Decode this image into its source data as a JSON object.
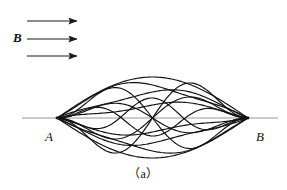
{
  "figure": {
    "caption": "（a）",
    "field_label": "B",
    "point_a_label": "A",
    "point_b_label": "B",
    "colors": {
      "trajectory": "#111111",
      "axis": "#8c8c8c",
      "arrow": "#1a1a1a",
      "background": "#ffffff",
      "text": "#111111"
    },
    "axis": {
      "x_start": 22,
      "x_end": 278,
      "y": 118
    },
    "focus_points": {
      "a": {
        "x": 57,
        "y": 118
      },
      "b": {
        "x": 248,
        "y": 118
      }
    },
    "field_arrows": [
      {
        "x1": 27,
        "y": 21,
        "x2": 77
      },
      {
        "x1": 27,
        "y": 39,
        "x2": 77
      },
      {
        "x1": 27,
        "y": 56,
        "x2": 77
      }
    ]
  },
  "chart_data": {
    "type": "line",
    "title": "",
    "xlabel": "",
    "ylabel": "",
    "xlim": [
      57,
      248
    ],
    "ylim": [
      158,
      77
    ],
    "grid": false,
    "legend": null,
    "series": [
      {
        "name": "trajectory-1",
        "amplitude": -41,
        "lobes": 1.0,
        "phase": 0.0,
        "skew": 0.0
      },
      {
        "name": "trajectory-2",
        "amplitude": -33,
        "lobes": 1.0,
        "phase": 0.0,
        "skew": 0.22
      },
      {
        "name": "trajectory-3",
        "amplitude": -26,
        "lobes": 1.0,
        "phase": 0.0,
        "skew": -0.24
      },
      {
        "name": "trajectory-4",
        "amplitude": -36,
        "lobes": 2.0,
        "phase": 0.0,
        "skew": 0.1
      },
      {
        "name": "trajectory-5",
        "amplitude": 31,
        "lobes": 2.0,
        "phase": 0.0,
        "skew": -0.12
      },
      {
        "name": "trajectory-6",
        "amplitude": 40,
        "lobes": 1.0,
        "phase": 0.0,
        "skew": 0.0
      },
      {
        "name": "trajectory-7",
        "amplitude": 33,
        "lobes": 1.0,
        "phase": 0.0,
        "skew": -0.2
      },
      {
        "name": "trajectory-8",
        "amplitude": 25,
        "lobes": 1.0,
        "phase": 0.0,
        "skew": 0.26
      },
      {
        "name": "trajectory-9",
        "amplitude": 34,
        "lobes": 2.0,
        "phase": 0.0,
        "skew": 0.34
      },
      {
        "name": "trajectory-10",
        "amplitude": -30,
        "lobes": 2.0,
        "phase": 0.0,
        "skew": -0.36
      },
      {
        "name": "trajectory-11",
        "amplitude": -18,
        "lobes": 3.0,
        "phase": 0.0,
        "skew": 0.05
      },
      {
        "name": "trajectory-12",
        "amplitude": 20,
        "lobes": 3.0,
        "phase": 0.0,
        "skew": -0.05
      },
      {
        "name": "trajectory-13",
        "amplitude": 14,
        "lobes": 1.0,
        "phase": 0.0,
        "skew": 0.45
      },
      {
        "name": "trajectory-14",
        "amplitude": -13,
        "lobes": 1.0,
        "phase": 0.0,
        "skew": -0.45
      }
    ]
  }
}
